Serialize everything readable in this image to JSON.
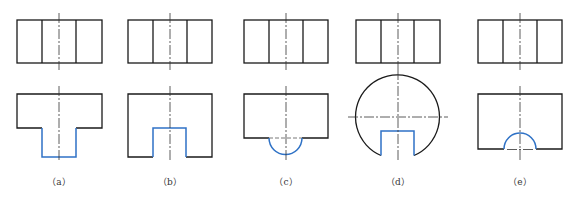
{
  "figure": {
    "panels": [
      {
        "id": "a",
        "label": "（a）",
        "cx": 59
      },
      {
        "id": "b",
        "label": "（b）",
        "cx": 170
      },
      {
        "id": "c",
        "label": "（c）",
        "cx": 286
      },
      {
        "id": "d",
        "label": "（d）",
        "cx": 398
      },
      {
        "id": "e",
        "label": "（e）",
        "cx": 520
      }
    ]
  },
  "colors": {
    "outline": "#1a1a1a",
    "highlight": "#2f72c6",
    "background": "#ffffff"
  }
}
